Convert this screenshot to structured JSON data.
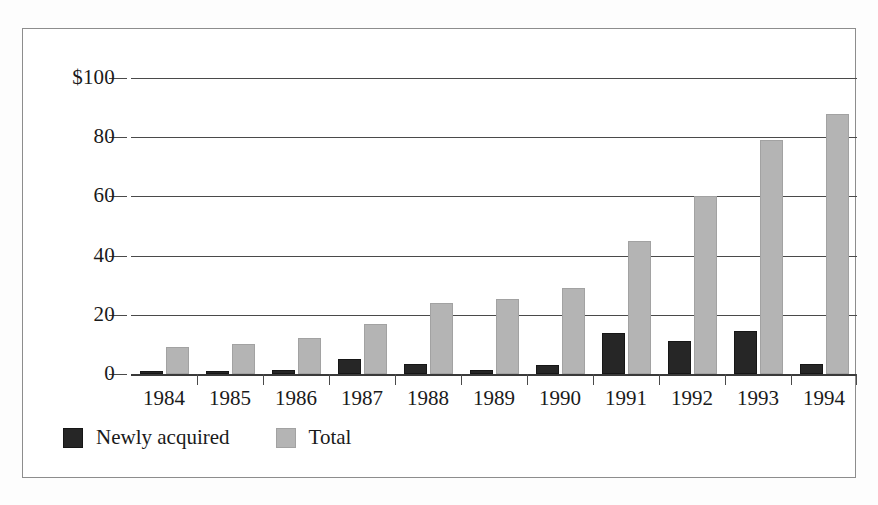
{
  "figure": {
    "frame_border_color": "#8d8d8d",
    "background_color": "#ffffff"
  },
  "legend": {
    "position": "bottom-left",
    "entries": [
      {
        "label": "Newly acquired",
        "color": "#262626",
        "swatch_icon": "filled-square-black"
      },
      {
        "label": "Total",
        "color": "#b4b4b4",
        "swatch_icon": "filled-square-gray"
      }
    ]
  },
  "chart_data": {
    "type": "bar",
    "title": "",
    "subtitle": "",
    "xlabel": "",
    "ylabel": "",
    "categories": [
      "1984",
      "1985",
      "1986",
      "1987",
      "1988",
      "1989",
      "1990",
      "1991",
      "1992",
      "1993",
      "1994"
    ],
    "series": [
      {
        "name": "Newly acquired",
        "color": "#262626",
        "values": [
          1,
          1,
          1.5,
          5,
          3.5,
          1.5,
          3,
          14,
          11,
          14.5,
          3.5
        ]
      },
      {
        "name": "Total",
        "color": "#b4b4b4",
        "values": [
          9,
          10,
          12,
          17,
          24,
          25.5,
          29,
          45,
          60,
          79,
          88
        ]
      }
    ],
    "ylim": [
      0,
      100
    ],
    "yticks": [
      0,
      20,
      40,
      60,
      80,
      100
    ],
    "ytick_labels": [
      "0",
      "20",
      "40",
      "60",
      "80",
      "$100"
    ],
    "grid": true,
    "grid_axis": "y",
    "legend_position": "bottom-left",
    "units": "dollars"
  }
}
